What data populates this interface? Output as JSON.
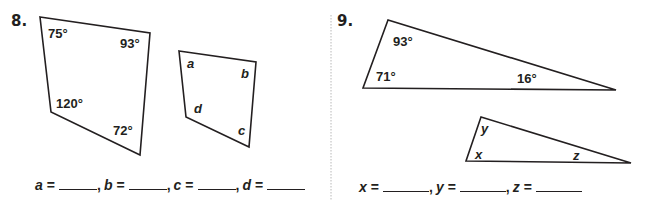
{
  "problems": [
    {
      "number": "8.",
      "figure_known": {
        "shape": "quadrilateral",
        "angles": [
          "75°",
          "93°",
          "72°",
          "120°"
        ]
      },
      "figure_unknown": {
        "shape": "quadrilateral",
        "angles": [
          "a",
          "b",
          "c",
          "d"
        ]
      },
      "answers": [
        {
          "var": "a",
          "eq": "=",
          "sep": ","
        },
        {
          "var": "b",
          "eq": "=",
          "sep": ","
        },
        {
          "var": "c",
          "eq": "=",
          "sep": ","
        },
        {
          "var": "d",
          "eq": "=",
          "sep": ""
        }
      ]
    },
    {
      "number": "9.",
      "figure_known": {
        "shape": "triangle",
        "angles": [
          "93°",
          "71°",
          "16°"
        ]
      },
      "figure_unknown": {
        "shape": "triangle",
        "angles": [
          "y",
          "x",
          "z"
        ]
      },
      "answers": [
        {
          "var": "x",
          "eq": "=",
          "sep": ","
        },
        {
          "var": "y",
          "eq": "=",
          "sep": ","
        },
        {
          "var": "z",
          "eq": "=",
          "sep": ""
        }
      ]
    }
  ],
  "colors": {
    "ink": "#231f20",
    "divider": "#b8b8b8",
    "background": "#ffffff"
  }
}
